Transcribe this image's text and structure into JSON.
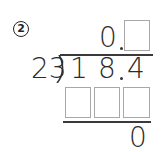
{
  "problem": {
    "number": "2",
    "quotient": {
      "whole": "0",
      "decimal_point": ".",
      "blank_count": 1
    },
    "divisor": "23",
    "dividend": {
      "digit_1": "1",
      "digit_2": "8",
      "decimal_point": ".",
      "digit_3": "4"
    },
    "product_row": {
      "blank_count": 3
    },
    "remainder": "0"
  }
}
